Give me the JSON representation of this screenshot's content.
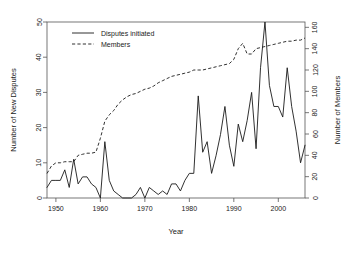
{
  "chart_data": {
    "type": "line",
    "title": "",
    "xlabel": "Year",
    "ylabel": "Number of New Disputes",
    "y2label": "Number of Members",
    "xlim": [
      1948,
      2006
    ],
    "ylim": [
      0,
      50
    ],
    "y2lim": [
      0,
      165
    ],
    "grid": false,
    "legend_position": "top-left",
    "x": [
      1948,
      1949,
      1950,
      1951,
      1952,
      1953,
      1954,
      1955,
      1956,
      1957,
      1958,
      1959,
      1960,
      1961,
      1962,
      1963,
      1964,
      1965,
      1966,
      1967,
      1968,
      1969,
      1970,
      1971,
      1972,
      1973,
      1974,
      1975,
      1976,
      1977,
      1978,
      1979,
      1980,
      1981,
      1982,
      1983,
      1984,
      1985,
      1986,
      1987,
      1988,
      1989,
      1990,
      1991,
      1992,
      1993,
      1994,
      1995,
      1996,
      1997,
      1998,
      1999,
      2000,
      2001,
      2002,
      2003,
      2004,
      2005,
      2006
    ],
    "series": [
      {
        "name": "Disputes initiated",
        "axis": "left",
        "style": "solid",
        "values": [
          3,
          5,
          5,
          5,
          8,
          3,
          11,
          4,
          6,
          6,
          4,
          3,
          0,
          16,
          5,
          2,
          1,
          0,
          0,
          0,
          1,
          3,
          0,
          3,
          2,
          1,
          2,
          1,
          4,
          4,
          2,
          5,
          7,
          7,
          29,
          13,
          16,
          7,
          12,
          18,
          26,
          15,
          9,
          21,
          16,
          22,
          30,
          14,
          37,
          50,
          32,
          26,
          26,
          23,
          37,
          26,
          19,
          10,
          15
        ]
      },
      {
        "name": "Members",
        "axis": "right",
        "style": "dashed",
        "values": [
          23,
          30,
          33,
          33,
          34,
          34,
          34,
          40,
          41,
          42,
          42,
          43,
          56,
          72,
          78,
          82,
          88,
          92,
          95,
          97,
          98,
          100,
          102,
          103,
          105,
          108,
          110,
          112,
          114,
          115,
          116,
          117,
          118,
          120,
          120,
          120,
          121,
          122,
          123,
          124,
          125,
          126,
          130,
          140,
          145,
          135,
          135,
          140,
          141,
          142,
          143,
          144,
          145,
          146,
          147,
          147,
          148,
          148,
          150
        ]
      }
    ],
    "xticks": [
      1950,
      1960,
      1970,
      1980,
      1990,
      2000
    ],
    "xtick_labels": [
      "1950",
      "1960",
      "1970",
      "1980",
      "1990",
      "2000"
    ],
    "yticks": [
      0,
      10,
      20,
      30,
      40,
      50
    ],
    "ytick_labels": [
      "0",
      "10",
      "20",
      "30",
      "40",
      "50"
    ],
    "y2ticks": [
      0,
      20,
      40,
      60,
      80,
      100,
      120,
      140,
      160
    ],
    "y2tick_labels": [
      "0",
      "20",
      "40",
      "60",
      "80",
      "100",
      "120",
      "140",
      "160"
    ]
  }
}
